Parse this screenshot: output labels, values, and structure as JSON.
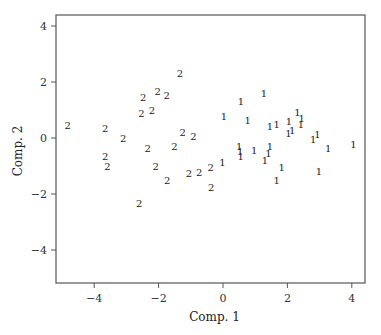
{
  "chart_data": {
    "type": "scatter",
    "title": "",
    "xlabel": "Comp. 1",
    "ylabel": "Comp. 2",
    "xlim": [
      -5.2,
      4.4
    ],
    "ylim": [
      -5.2,
      4.4
    ],
    "xticks": [
      -4,
      -2,
      0,
      2,
      4
    ],
    "yticks": [
      -4,
      -2,
      0,
      2,
      4
    ],
    "xtick_labels": [
      "−4",
      "−2",
      "0",
      "2",
      "4"
    ],
    "ytick_labels": [
      "−4",
      "−2",
      "0",
      "2",
      "4"
    ],
    "grid": false,
    "legend": null,
    "marker_style": "text labels (group number)",
    "series": [
      {
        "name": "1",
        "marker": "1",
        "points": [
          [
            1.27,
            1.6
          ],
          [
            0.56,
            1.3
          ],
          [
            0.03,
            0.76
          ],
          [
            0.77,
            0.62
          ],
          [
            1.46,
            0.4
          ],
          [
            1.67,
            0.5
          ],
          [
            2.05,
            0.6
          ],
          [
            2.31,
            0.9
          ],
          [
            2.44,
            0.7
          ],
          [
            2.42,
            0.5
          ],
          [
            2.03,
            0.17
          ],
          [
            2.15,
            0.26
          ],
          [
            2.8,
            -0.05
          ],
          [
            2.93,
            0.13
          ],
          [
            3.27,
            -0.37
          ],
          [
            4.05,
            -0.23
          ],
          [
            0.5,
            -0.31
          ],
          [
            0.53,
            -0.49
          ],
          [
            0.55,
            -0.67
          ],
          [
            0.97,
            -0.43
          ],
          [
            1.46,
            -0.31
          ],
          [
            1.41,
            -0.55
          ],
          [
            1.3,
            -0.82
          ],
          [
            -0.02,
            -0.88
          ],
          [
            1.82,
            -1.06
          ],
          [
            2.98,
            -1.2
          ],
          [
            1.67,
            -1.52
          ]
        ]
      },
      {
        "name": "2",
        "marker": "2",
        "points": [
          [
            -1.34,
            2.29
          ],
          [
            -2.48,
            1.44
          ],
          [
            -2.03,
            1.65
          ],
          [
            -1.75,
            1.51
          ],
          [
            -2.53,
            0.86
          ],
          [
            -2.21,
            1.0
          ],
          [
            -4.82,
            0.46
          ],
          [
            -3.66,
            0.35
          ],
          [
            -3.1,
            -0.01
          ],
          [
            -1.25,
            0.2
          ],
          [
            -0.92,
            0.05
          ],
          [
            -2.34,
            -0.37
          ],
          [
            -1.51,
            -0.31
          ],
          [
            -3.66,
            -0.67
          ],
          [
            -3.59,
            -1.02
          ],
          [
            -2.09,
            -1.02
          ],
          [
            -1.73,
            -1.5
          ],
          [
            -1.06,
            -1.26
          ],
          [
            -0.74,
            -1.23
          ],
          [
            -0.38,
            -1.06
          ],
          [
            -0.37,
            -1.77
          ],
          [
            -2.6,
            -2.33
          ]
        ]
      }
    ]
  },
  "layout": {
    "frame": {
      "left": 56,
      "top": 15,
      "right": 365,
      "bottom": 283
    },
    "x_origin_px": 223,
    "x_unit_px": 32.2,
    "y_origin_px": 138,
    "y_unit_px": 28.0,
    "frame_color": "#555555",
    "text_color": "#222222"
  }
}
